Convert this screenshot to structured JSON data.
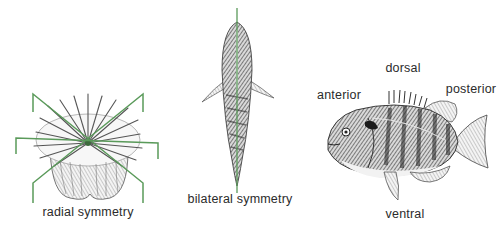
{
  "figure": {
    "panels": [
      {
        "id": "radial",
        "caption": "radial symmetry",
        "subject": "sea anemone / coral polyp illustration"
      },
      {
        "id": "bilateral",
        "caption": "bilateral symmetry",
        "subject": "fish seen from above"
      },
      {
        "id": "orientation",
        "subject": "sunfish side view",
        "labels": {
          "anterior": "anterior",
          "dorsal": "dorsal",
          "posterior": "posterior",
          "ventral": "ventral"
        }
      }
    ],
    "colors": {
      "axis_line": "#5a9a5a",
      "ink": "#2b2b2b",
      "background": "#ffffff"
    }
  }
}
